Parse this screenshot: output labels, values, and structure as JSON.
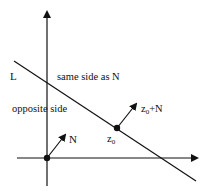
{
  "diagram": {
    "line_label": "L",
    "same_side_label": "same side as N",
    "opposite_side_label": "opposite side",
    "normal_label": "N",
    "point_label": "z",
    "point_sub": "0",
    "shifted_label_pre": "z",
    "shifted_label_sub": "0",
    "shifted_label_post": "+N",
    "colors": {
      "stroke": "#111111",
      "background": "#ffffff"
    }
  }
}
